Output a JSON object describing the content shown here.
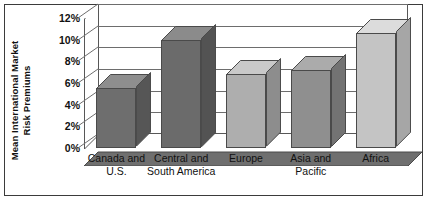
{
  "chart_data": {
    "type": "bar",
    "title": "",
    "subtitle": "",
    "xlabel": "",
    "ylabel": "Mean International Market Risk Premiums",
    "ylabel_line1": "Mean International Market",
    "ylabel_line2": "Risk Premiums",
    "categories": [
      "Canada and U.S.",
      "Central and South America",
      "Europe",
      "Asia and Pacific",
      "Africa"
    ],
    "category_lines": [
      [
        "Canada and",
        "U.S."
      ],
      [
        "Central and",
        "South America"
      ],
      [
        "Europe",
        ""
      ],
      [
        "Asia and",
        "Pacific"
      ],
      [
        "Africa",
        ""
      ]
    ],
    "values": [
      5.5,
      10.0,
      6.8,
      7.2,
      10.6
    ],
    "value_labels": [
      "5.5%",
      "10.0%",
      "6.8%",
      "7.2%",
      "10.6%"
    ],
    "ylim": [
      0,
      12
    ],
    "ytick_values": [
      0,
      2,
      4,
      6,
      8,
      10,
      12
    ],
    "ytick_labels": [
      "0%",
      "2%",
      "4%",
      "6%",
      "8%",
      "10%",
      "12%"
    ],
    "grid": true,
    "grid_axis": "y",
    "legend": false,
    "legend_position": "none",
    "three_d": true,
    "bar_colors": [
      "#6e6e6e",
      "#6b6b6b",
      "#aeaeae",
      "#8f8f8f",
      "#c4c4c4"
    ],
    "bar_top_colors": [
      "#8e8e8e",
      "#8b8b8b",
      "#c9c9c9",
      "#ababab",
      "#dcdcdc"
    ],
    "bar_side_colors": [
      "#565656",
      "#535353",
      "#8d8d8d",
      "#737373",
      "#a6a6a6"
    ]
  },
  "style": {
    "background": "#ffffff",
    "frame_color": "#3b3b3b",
    "grid_color": "#6d6d6d",
    "axis_text_color": "#111111",
    "floor_color": "#6f6f6f",
    "floor_edge_color": "#4a4a4a"
  }
}
